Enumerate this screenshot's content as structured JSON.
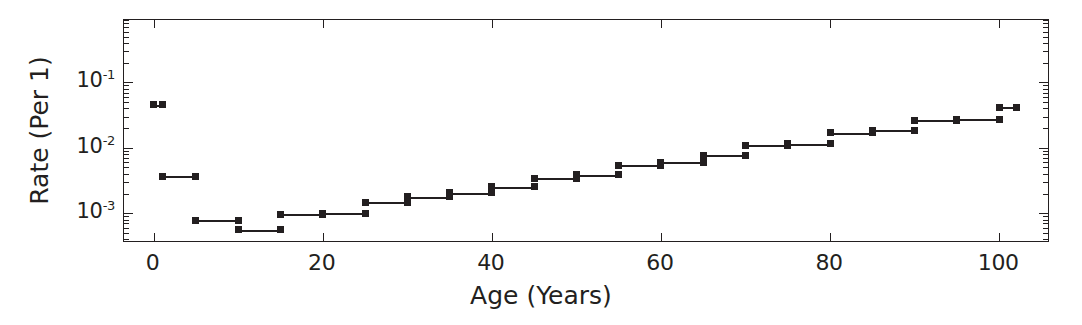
{
  "chart_data": {
    "type": "line",
    "title": "",
    "xlabel": "Age (Years)",
    "ylabel": "Rate (Per 1)",
    "yscale": "log",
    "xscale": "linear",
    "xlim": [
      -3.5,
      106
    ],
    "ylim": [
      0.00035,
      0.9
    ],
    "grid": false,
    "legend": null,
    "style": "step-segments",
    "xticks": [
      0,
      20,
      40,
      60,
      80,
      100
    ],
    "xtick_labels": [
      "0",
      "20",
      "40",
      "60",
      "80",
      "100"
    ],
    "yticks": [
      0.1,
      0.01,
      0.001
    ],
    "ytick_labels": [
      "10-1",
      "10-2",
      "10-3"
    ],
    "ytick_mantissas": [
      "10",
      "10",
      "10"
    ],
    "ytick_exponents": [
      "-1",
      "-2",
      "-3"
    ],
    "marker": "square",
    "color": "#231f20",
    "series": [
      {
        "name": "Rate by age band",
        "x_bands": [
          [
            0,
            1
          ],
          [
            1,
            5
          ],
          [
            5,
            10
          ],
          [
            10,
            15
          ],
          [
            15,
            20
          ],
          [
            20,
            25
          ],
          [
            25,
            30
          ],
          [
            30,
            35
          ],
          [
            35,
            40
          ],
          [
            40,
            45
          ],
          [
            45,
            50
          ],
          [
            50,
            55
          ],
          [
            55,
            60
          ],
          [
            60,
            65
          ],
          [
            65,
            70
          ],
          [
            70,
            75
          ],
          [
            75,
            80
          ],
          [
            80,
            85
          ],
          [
            85,
            90
          ],
          [
            90,
            95
          ],
          [
            95,
            100
          ],
          [
            100,
            102
          ]
        ],
        "values": [
          0.0455,
          0.0037,
          0.00078,
          0.00056,
          0.00097,
          0.001,
          0.00148,
          0.00178,
          0.00205,
          0.00255,
          0.0034,
          0.0039,
          0.0054,
          0.006,
          0.00775,
          0.011,
          0.0115,
          0.017,
          0.0185,
          0.0265,
          0.0275,
          0.042
        ],
        "band_labels": [
          "0-1",
          "1-5",
          "5-10",
          "10-15",
          "15-20",
          "20-25",
          "25-30",
          "30-35",
          "35-40",
          "40-45",
          "45-50",
          "50-55",
          "55-60",
          "60-65",
          "65-70",
          "70-75",
          "75-80",
          "80-85",
          "85-90",
          "90-95",
          "95-100",
          "100-102"
        ]
      }
    ],
    "points": [
      {
        "age": 0,
        "rate": 0.0455
      },
      {
        "age": 1,
        "rate": 0.0455
      },
      {
        "age": 1,
        "rate": 0.0037
      },
      {
        "age": 5,
        "rate": 0.0037
      },
      {
        "age": 5,
        "rate": 0.00078
      },
      {
        "age": 10,
        "rate": 0.00078
      },
      {
        "age": 10,
        "rate": 0.00056
      },
      {
        "age": 15,
        "rate": 0.00056
      },
      {
        "age": 15,
        "rate": 0.00097
      },
      {
        "age": 20,
        "rate": 0.00097
      },
      {
        "age": 20,
        "rate": 0.001
      },
      {
        "age": 25,
        "rate": 0.001
      },
      {
        "age": 25,
        "rate": 0.00148
      },
      {
        "age": 30,
        "rate": 0.00148
      },
      {
        "age": 30,
        "rate": 0.00178
      },
      {
        "age": 35,
        "rate": 0.00178
      },
      {
        "age": 35,
        "rate": 0.00205
      },
      {
        "age": 40,
        "rate": 0.00205
      },
      {
        "age": 40,
        "rate": 0.00255
      },
      {
        "age": 45,
        "rate": 0.00255
      },
      {
        "age": 45,
        "rate": 0.0034
      },
      {
        "age": 50,
        "rate": 0.0034
      },
      {
        "age": 50,
        "rate": 0.0039
      },
      {
        "age": 55,
        "rate": 0.0039
      },
      {
        "age": 55,
        "rate": 0.0054
      },
      {
        "age": 60,
        "rate": 0.0054
      },
      {
        "age": 60,
        "rate": 0.006
      },
      {
        "age": 65,
        "rate": 0.006
      },
      {
        "age": 65,
        "rate": 0.00775
      },
      {
        "age": 70,
        "rate": 0.00775
      },
      {
        "age": 70,
        "rate": 0.011
      },
      {
        "age": 75,
        "rate": 0.011
      },
      {
        "age": 75,
        "rate": 0.0115
      },
      {
        "age": 80,
        "rate": 0.0115
      },
      {
        "age": 80,
        "rate": 0.017
      },
      {
        "age": 85,
        "rate": 0.017
      },
      {
        "age": 85,
        "rate": 0.0185
      },
      {
        "age": 90,
        "rate": 0.0185
      },
      {
        "age": 90,
        "rate": 0.0265
      },
      {
        "age": 95,
        "rate": 0.0265
      },
      {
        "age": 95,
        "rate": 0.0275
      },
      {
        "age": 100,
        "rate": 0.0275
      },
      {
        "age": 100,
        "rate": 0.042
      },
      {
        "age": 102,
        "rate": 0.042
      }
    ]
  }
}
